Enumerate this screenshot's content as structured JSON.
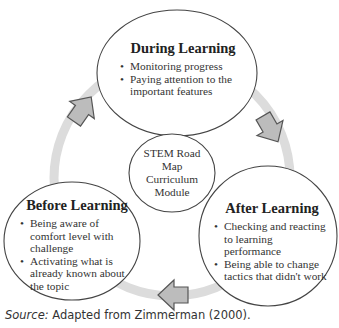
{
  "diagram": {
    "center": {
      "label": "STEM Road Map Curriculum Module",
      "lines": [
        "STEM Road",
        "Map",
        "Curriculum",
        "Module"
      ]
    },
    "nodes": [
      {
        "title": "During Learning",
        "bullets": [
          "Monitoring progress",
          "Paying attention to the important features"
        ]
      },
      {
        "title": "After Learning",
        "bullets": [
          "Checking and reacting to learning performance",
          "Being able to change tactics that didn't work"
        ]
      },
      {
        "title": "Before Learning",
        "bullets": [
          "Being aware of comfort level with challenge",
          "Activating what is already known about the topic"
        ]
      }
    ],
    "flow": [
      "Before Learning",
      "During Learning",
      "After Learning",
      "Before Learning"
    ],
    "colors": {
      "ring": "#d9d9d9",
      "arrow_fill": "#b8b8b8",
      "arrow_stroke": "#555555",
      "circle_stroke": "#444444"
    }
  },
  "source": {
    "label": "Source:",
    "text": " Adapted from Zimmerman (2000)."
  }
}
